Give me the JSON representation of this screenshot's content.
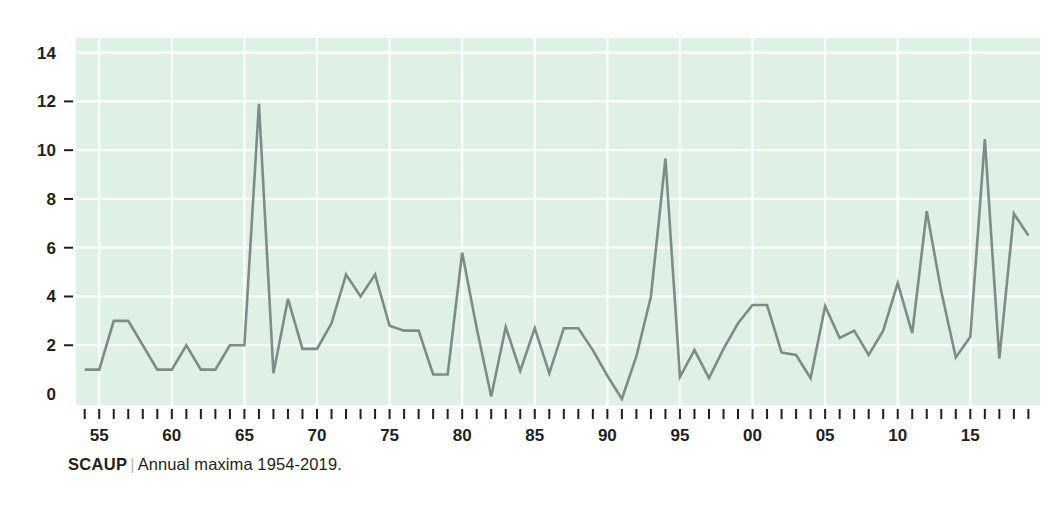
{
  "caption": {
    "species": "SCAUP",
    "divider": "|",
    "subtitle": "Annual maxima 1954-2019."
  },
  "chart_data": {
    "type": "line",
    "title": "SCAUP",
    "subtitle": "Annual maxima 1954-2019.",
    "xlabel": "",
    "ylabel": "",
    "xlim": [
      1953.4,
      2019.8
    ],
    "ylim": [
      -0.45,
      14.6
    ],
    "grid": true,
    "grid_color": "#ffffff",
    "plot_background": "#dff0e4",
    "line_color": "#7b8d88",
    "legend": "none",
    "y_ticks": [
      0,
      2,
      4,
      6,
      8,
      10,
      12,
      14
    ],
    "y_tick_labels": [
      "0",
      "2",
      "4",
      "6",
      "8",
      "10",
      "12",
      "14"
    ],
    "x_tick_years_minor_step": 1,
    "x_tick_label_years": [
      1955,
      1960,
      1965,
      1970,
      1975,
      1980,
      1985,
      1990,
      1995,
      2000,
      2005,
      2010,
      2015
    ],
    "x_tick_labels": [
      "55",
      "60",
      "65",
      "70",
      "75",
      "80",
      "85",
      "90",
      "95",
      "00",
      "05",
      "10",
      "15"
    ],
    "x": [
      1954,
      1955,
      1956,
      1957,
      1958,
      1959,
      1960,
      1961,
      1962,
      1963,
      1964,
      1965,
      1966,
      1967,
      1968,
      1969,
      1970,
      1971,
      1972,
      1973,
      1974,
      1975,
      1976,
      1977,
      1978,
      1979,
      1980,
      1981,
      1982,
      1983,
      1984,
      1985,
      1986,
      1987,
      1988,
      1989,
      1990,
      1991,
      1992,
      1993,
      1994,
      1995,
      1996,
      1997,
      1998,
      1999,
      2000,
      2001,
      2002,
      2003,
      2004,
      2005,
      2006,
      2007,
      2008,
      2009,
      2010,
      2011,
      2012,
      2013,
      2014,
      2015,
      2016,
      2017,
      2018,
      2019
    ],
    "values": [
      1.0,
      1.0,
      3.0,
      3.0,
      2.0,
      1.0,
      1.0,
      2.0,
      1.0,
      1.0,
      2.0,
      2.0,
      11.9,
      0.85,
      3.9,
      1.85,
      1.85,
      2.9,
      4.9,
      4.0,
      4.9,
      2.8,
      2.6,
      2.6,
      0.8,
      0.8,
      5.8,
      2.7,
      -0.1,
      2.75,
      0.95,
      2.7,
      0.85,
      2.7,
      2.7,
      1.8,
      0.75,
      -0.2,
      1.55,
      4.0,
      9.65,
      0.7,
      1.8,
      0.65,
      1.85,
      2.9,
      3.65,
      3.65,
      1.7,
      1.6,
      0.65,
      3.6,
      2.3,
      2.6,
      1.6,
      2.6,
      4.55,
      2.5,
      7.5,
      4.2,
      1.5,
      2.35,
      10.45,
      1.45,
      7.4,
      6.5
    ],
    "series_name": "Annual maxima"
  },
  "plot_geometry": {
    "left": 76,
    "right": 1040,
    "top": 38,
    "bottom": 405
  }
}
